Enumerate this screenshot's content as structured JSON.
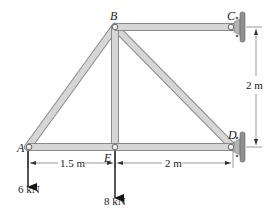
{
  "joints": {
    "A": {
      "label": "A"
    },
    "B": {
      "label": "B"
    },
    "C": {
      "label": "C"
    },
    "D": {
      "label": "D"
    },
    "E": {
      "label": "E"
    }
  },
  "members": [
    "AB",
    "BC",
    "BE",
    "BD",
    "AE",
    "ED"
  ],
  "supports": [
    "C",
    "D"
  ],
  "dimensions": {
    "AE": "1.5 m",
    "ED": "2 m",
    "CD_vertical": "2 m"
  },
  "loads": {
    "A": "6 kN",
    "E": "8 kN"
  },
  "colors": {
    "member_fill": "#d6d6d6",
    "member_edge": "#8a8a8a",
    "wall": "#9a9a9a",
    "ink": "#222222"
  }
}
